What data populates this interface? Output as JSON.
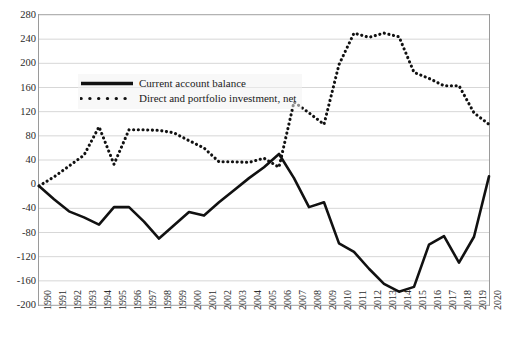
{
  "chart_data": {
    "type": "line",
    "title": "",
    "xlabel": "",
    "ylabel": "",
    "xlim": [
      1990,
      2020
    ],
    "ylim": [
      -200,
      280
    ],
    "ytick_step": 40,
    "grid": "horizontal",
    "legend_position": "upper-left-inside",
    "yticks": [
      280,
      240,
      200,
      160,
      120,
      80,
      40,
      0,
      -40,
      -80,
      -120,
      -160,
      -200
    ],
    "categories": [
      1990,
      1991,
      1992,
      1993,
      1994,
      1995,
      1996,
      1997,
      1998,
      1999,
      2000,
      2001,
      2002,
      2003,
      2004,
      2005,
      2006,
      2007,
      2008,
      2009,
      2010,
      2011,
      2012,
      2013,
      2014,
      2015,
      2016,
      2017,
      2018,
      2019,
      2020
    ],
    "series": [
      {
        "name": "Current account balance",
        "style": "solid",
        "color": "#111111",
        "values": [
          -3,
          -25,
          -45,
          -55,
          -67,
          -38,
          -38,
          -62,
          -90,
          -68,
          -46,
          -52,
          -30,
          -10,
          10,
          28,
          50,
          10,
          -38,
          -30,
          -98,
          -112,
          -140,
          -165,
          -178,
          -170,
          -100,
          -86,
          -130,
          -87,
          13
        ]
      },
      {
        "name": "Direct and portfolio investment, net",
        "style": "dotted",
        "color": "#111111",
        "values": [
          -3,
          12,
          30,
          48,
          95,
          33,
          90,
          90,
          89,
          85,
          72,
          60,
          37,
          37,
          36,
          43,
          28,
          136,
          118,
          99,
          198,
          250,
          243,
          250,
          244,
          185,
          175,
          163,
          163,
          118,
          99
        ]
      }
    ]
  },
  "legend": {
    "items": [
      {
        "label": "Current account balance",
        "style": "solid"
      },
      {
        "label": "Direct and portfolio investment, net",
        "style": "dotted"
      }
    ]
  }
}
